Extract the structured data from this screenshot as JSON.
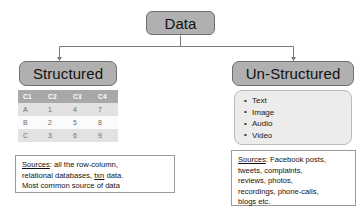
{
  "diagram": {
    "root": {
      "label": "Data"
    },
    "colors": {
      "node_fill": "#b0b0b0",
      "node_border": "#6e6e6e",
      "table_header_fill": "#a8a8a8",
      "table_row_alt_fill": "#e2e2e2",
      "bullet_box_fill": "#ececec",
      "connector": "#7a7a7a",
      "page_background": "#ffffff"
    },
    "branches": [
      {
        "label": "Structured",
        "table": {
          "columns": [
            "C1",
            "C2",
            "C3",
            "C4"
          ],
          "rows": [
            [
              "A",
              "1",
              "4",
              "7"
            ],
            [
              "B",
              "2",
              "5",
              "8"
            ],
            [
              "C",
              "3",
              "6",
              "9"
            ]
          ]
        },
        "sources": {
          "label": "Sources",
          "separator": ":",
          "lines": [
            " all the row-column,",
            "relational databases, txn data.",
            "Most common source of data"
          ],
          "line1_text": " all the row-column,",
          "line2_prefix": "relational databases, ",
          "line2_underlined": "txn",
          "line2_suffix": " data.",
          "line3_text": "Most common source of data"
        }
      },
      {
        "label": "Un-Structured",
        "bullets": [
          "Text",
          "Image",
          "Audio",
          "Video"
        ],
        "sources": {
          "label": "Sources",
          "separator": ":",
          "lines": [
            " Facebook posts,",
            "tweets, complaints,",
            "reviews, photos,",
            "recordings, phone-calls,",
            "blogs etc."
          ],
          "line1_text": " Facebook posts,",
          "line2_text": "tweets, complaints,",
          "line3_text": "reviews, photos,",
          "line4_text": "recordings, phone-calls,",
          "line5_text": "blogs etc."
        }
      }
    ]
  }
}
